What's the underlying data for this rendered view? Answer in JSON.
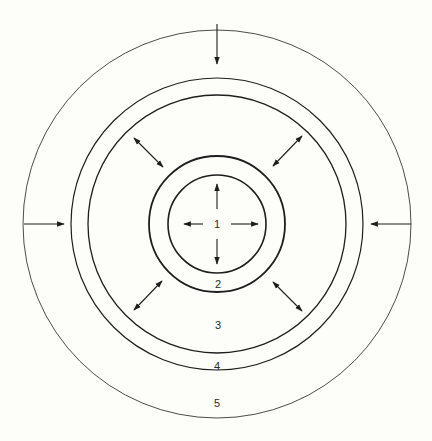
{
  "diagram": {
    "center": [
      217,
      224
    ],
    "rings": [
      {
        "id": "ring-1",
        "r": 49,
        "stroke": 1.6,
        "label": "1",
        "label_pos": [
          217,
          224
        ]
      },
      {
        "id": "ring-2",
        "r": 68,
        "stroke": 1.8,
        "label": "2",
        "label_pos": [
          218,
          284
        ]
      },
      {
        "id": "ring-3",
        "r": 129,
        "stroke": 1.3,
        "label": "3",
        "label_pos": [
          218,
          325
        ]
      },
      {
        "id": "ring-4",
        "r": 146,
        "stroke": 1.2,
        "label": "4",
        "label_pos": [
          217,
          366
        ]
      },
      {
        "id": "ring-5",
        "r": 194,
        "stroke": 0.8,
        "label": "5",
        "label_pos": [
          217,
          403
        ]
      }
    ],
    "arrows": {
      "inward": [
        {
          "from": [
            217,
            24
          ],
          "to": [
            217,
            64
          ]
        },
        {
          "from": [
            24,
            224
          ],
          "to": [
            64,
            224
          ]
        },
        {
          "from": [
            411,
            224
          ],
          "to": [
            371,
            224
          ]
        }
      ],
      "outward_center": [
        {
          "from": [
            217,
            209
          ],
          "to": [
            217,
            184
          ]
        },
        {
          "from": [
            217,
            239
          ],
          "to": [
            217,
            264
          ]
        },
        {
          "from": [
            203,
            224
          ],
          "to": [
            184,
            224
          ]
        },
        {
          "from": [
            231,
            224
          ],
          "to": [
            258,
            224
          ]
        }
      ],
      "double_diagonal": [
        {
          "from": [
            134,
            138
          ],
          "to": [
            163,
            167
          ]
        },
        {
          "from": [
            273,
            166
          ],
          "to": [
            302,
            136
          ]
        },
        {
          "from": [
            134,
            310
          ],
          "to": [
            162,
            281
          ]
        },
        {
          "from": [
            273,
            282
          ],
          "to": [
            302,
            311
          ]
        }
      ]
    },
    "colors": {
      "line": "#1e1e1e",
      "background": "#fdfdfa"
    }
  }
}
